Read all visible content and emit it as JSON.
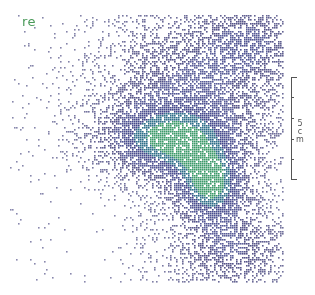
{
  "image": {
    "label": "re",
    "label_color": "#4a9a5a",
    "scale_bar": {
      "value": "5",
      "unit": "cm",
      "label_lines": [
        "5",
        "c",
        "m"
      ]
    },
    "colormap": [
      "#2b2a6b",
      "#3a3f85",
      "#2f6f8a",
      "#3d9a6a",
      "#8fc45a"
    ],
    "density_blobs": [
      {
        "cx": 195,
        "cy": 80,
        "rx": 90,
        "ry": 70,
        "weight": 0.55
      },
      {
        "cx": 165,
        "cy": 140,
        "rx": 65,
        "ry": 35,
        "weight": 0.9
      },
      {
        "cx": 210,
        "cy": 185,
        "rx": 35,
        "ry": 35,
        "weight": 1.0
      },
      {
        "cx": 230,
        "cy": 250,
        "rx": 55,
        "ry": 40,
        "weight": 0.55
      },
      {
        "cx": 250,
        "cy": 40,
        "rx": 40,
        "ry": 30,
        "weight": 0.4
      }
    ],
    "extent": {
      "x0": 10,
      "x1": 284,
      "y0": 15,
      "y1": 283
    }
  }
}
